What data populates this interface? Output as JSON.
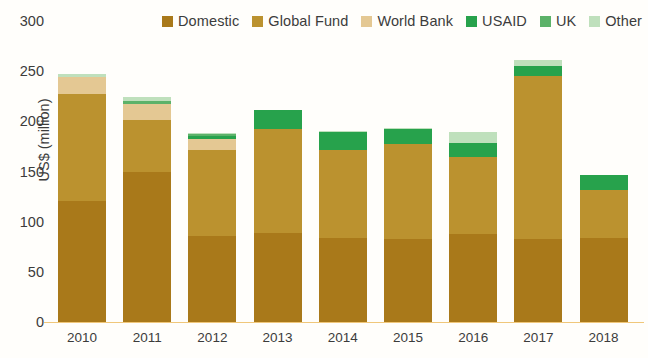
{
  "chart_data": {
    "type": "bar",
    "subtype": "stacked-vertical",
    "title": "",
    "xlabel": "",
    "ylabel": "US$ (million)",
    "ylim": [
      0,
      300
    ],
    "yticks": [
      0,
      50,
      100,
      150,
      200,
      250,
      300
    ],
    "grid": false,
    "legend_position": "top-right",
    "categories": [
      "2010",
      "2011",
      "2012",
      "2013",
      "2014",
      "2015",
      "2016",
      "2017",
      "2018"
    ],
    "series": [
      {
        "name": "Domestic",
        "color": "#a9791a",
        "values": [
          121,
          150,
          86,
          89,
          84,
          83,
          88,
          83,
          84
        ]
      },
      {
        "name": "Global Fund",
        "color": "#bb922f",
        "values": [
          106,
          51,
          85,
          103,
          87,
          94,
          76,
          162,
          48
        ]
      },
      {
        "name": "World Bank",
        "color": "#e4c893",
        "values": [
          17,
          16,
          11,
          0,
          0,
          0,
          0,
          0,
          0
        ]
      },
      {
        "name": "USAID",
        "color": "#27a24c",
        "values": [
          0,
          0,
          3,
          19,
          18,
          15,
          14,
          10,
          15
        ]
      },
      {
        "name": "UK",
        "color": "#5cb269",
        "values": [
          0,
          3,
          2,
          0,
          0,
          0,
          0,
          0,
          0
        ]
      },
      {
        "name": "Other",
        "color": "#bfe0bc",
        "values": [
          3,
          4,
          1,
          0,
          1,
          1,
          11,
          6,
          0
        ]
      }
    ],
    "totals": [
      247,
      224,
      188,
      211,
      190,
      193,
      189,
      261,
      147
    ]
  },
  "legend": {
    "items": [
      {
        "label": "Domestic",
        "swatch": "#a9791a"
      },
      {
        "label": "Global Fund",
        "swatch": "#bb922f"
      },
      {
        "label": "World Bank",
        "swatch": "#e4c893"
      },
      {
        "label": "USAID",
        "swatch": "#27a24c"
      },
      {
        "label": "UK",
        "swatch": "#5cb269"
      },
      {
        "label": "Other",
        "swatch": "#bfe0bc"
      }
    ]
  },
  "axes": {
    "y_title": "US$ (million)",
    "y_ticks": [
      "300",
      "250",
      "200",
      "150",
      "100",
      "50",
      "0"
    ],
    "x_ticks": [
      "2010",
      "2011",
      "2012",
      "2013",
      "2014",
      "2015",
      "2016",
      "2017",
      "2018"
    ]
  }
}
